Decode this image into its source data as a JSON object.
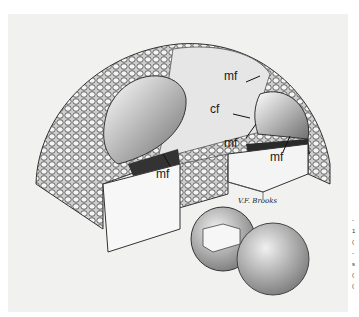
{
  "figure": {
    "labels": {
      "mf_top": "mf",
      "cf": "cf",
      "mf_center": "mf",
      "mf_right": "mf",
      "mf_left": "mf"
    },
    "signature": "V.F. Brooks",
    "edge_text": [
      "-",
      "1",
      "(",
      "-",
      "s",
      "(",
      "("
    ]
  }
}
